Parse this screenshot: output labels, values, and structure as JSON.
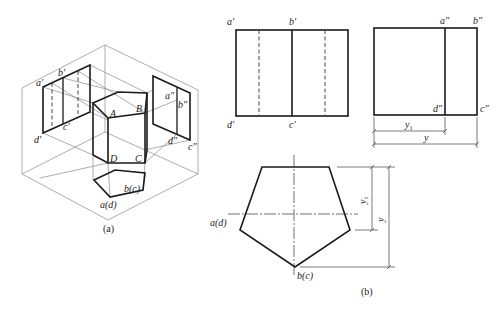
{
  "figure": {
    "panel_a": {
      "caption": "(a)",
      "vertex_labels": {
        "A": "A",
        "B": "B",
        "C": "C",
        "D": "D",
        "a_prime": "a′",
        "b_prime": "b′",
        "c_prime": "c′",
        "d_prime": "d′",
        "a_dprime": "a″",
        "b_dprime": "b″",
        "c_dprime": "c″",
        "d_dprime": "d″",
        "ad": "a(d)",
        "bc": "b(c)"
      }
    },
    "panel_b": {
      "caption": "(b)",
      "front_view": {
        "labels": {
          "a_prime": "a′",
          "b_prime": "b′",
          "c_prime": "c′",
          "d_prime": "d′"
        }
      },
      "side_view": {
        "labels": {
          "a_dprime": "a″",
          "b_dprime": "b″",
          "c_dprime": "c″",
          "d_dprime": "d″"
        },
        "dimensions": {
          "y1": "y",
          "y1_sub": "1",
          "y": "y"
        }
      },
      "top_view": {
        "labels": {
          "ad": "a(d)",
          "bc": "b(c)"
        },
        "dimensions": {
          "y1": "y",
          "y1_sub": "1",
          "y": "y"
        }
      }
    }
  }
}
